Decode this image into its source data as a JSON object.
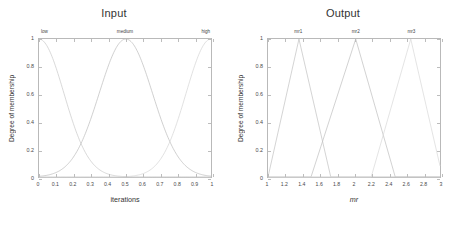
{
  "figure": {
    "background": "#ffffff",
    "axis_color": "#b9b9b9",
    "text_color": "#333333"
  },
  "panels": [
    {
      "id": "input",
      "title": "Input",
      "xlabel": "iterations",
      "ylabel": "Degree of membership",
      "xlabel_italic": false,
      "xticks": [
        "0",
        "0.1",
        "0.2",
        "0.3",
        "0.4",
        "0.5",
        "0.6",
        "0.7",
        "0.8",
        "0.9",
        "1"
      ],
      "xtickvals": [
        0,
        0.1,
        0.2,
        0.3,
        0.4,
        0.5,
        0.6,
        0.7,
        0.8,
        0.9,
        1
      ],
      "yticks": [
        "0",
        "0.2",
        "0.4",
        "0.6",
        "0.8",
        "1"
      ],
      "ytickvals": [
        0,
        0.2,
        0.4,
        0.6,
        0.8,
        1
      ],
      "xlim": [
        0,
        1
      ],
      "ylim": [
        0,
        1
      ],
      "mf_labels": [
        {
          "text": "low",
          "x": 0.02,
          "anchor": "left"
        },
        {
          "text": "medium",
          "x": 0.5,
          "anchor": "center"
        },
        {
          "text": "high",
          "x": 0.985,
          "anchor": "right"
        }
      ]
    },
    {
      "id": "output",
      "title": "Output",
      "xlabel": "mr",
      "ylabel": "Degree of membership",
      "xlabel_italic": true,
      "xticks": [
        "1",
        "1.2",
        "1.4",
        "1.6",
        "1.8",
        "2",
        "2.2",
        "2.4",
        "2.6",
        "2.8",
        "3"
      ],
      "xtickvals": [
        1,
        1.2,
        1.4,
        1.6,
        1.8,
        2,
        2.2,
        2.4,
        2.6,
        2.8,
        3
      ],
      "yticks": [
        "0",
        "0.2",
        "0.4",
        "0.6",
        "0.8",
        "1"
      ],
      "ytickvals": [
        0,
        0.2,
        0.4,
        0.6,
        0.8,
        1
      ],
      "xlim": [
        1,
        3
      ],
      "ylim": [
        0,
        1
      ],
      "mf_labels": [
        {
          "text": "mr1",
          "x": 1.36,
          "anchor": "center"
        },
        {
          "text": "mr2",
          "x": 2.02,
          "anchor": "center"
        },
        {
          "text": "mr3",
          "x": 2.66,
          "anchor": "center"
        }
      ]
    }
  ],
  "chart_data": [
    {
      "type": "line",
      "title": "Input",
      "xlabel": "iterations",
      "ylabel": "Degree of membership",
      "xlim": [
        0,
        1
      ],
      "ylim": [
        0,
        1
      ],
      "grid": false,
      "legend": "inline-labels-above-axes",
      "note": "Fuzzy Gaussian membership functions for the input variable",
      "series": [
        {
          "name": "low",
          "shape": "gaussmf",
          "color": "#c9c9c9",
          "params": {
            "sigma": 0.145,
            "center": 0.0
          },
          "x": [
            0,
            0.05,
            0.1,
            0.15,
            0.2,
            0.25,
            0.3,
            0.35,
            0.4,
            0.5,
            0.6,
            0.7,
            0.8,
            0.9,
            1.0
          ],
          "y": [
            1.0,
            0.942,
            0.787,
            0.583,
            0.384,
            0.225,
            0.117,
            0.054,
            0.022,
            0.002,
            0.0,
            0.0,
            0.0,
            0.0,
            0.0
          ]
        },
        {
          "name": "medium",
          "shape": "gaussmf",
          "color": "#bcbcbc",
          "params": {
            "sigma": 0.155,
            "center": 0.505
          },
          "x": [
            0,
            0.1,
            0.2,
            0.25,
            0.3,
            0.35,
            0.4,
            0.45,
            0.5,
            0.55,
            0.6,
            0.65,
            0.7,
            0.75,
            0.8,
            0.9,
            1.0
          ],
          "y": [
            0.042,
            0.123,
            0.288,
            0.396,
            0.54,
            0.689,
            0.83,
            0.942,
            0.999,
            0.986,
            0.895,
            0.756,
            0.598,
            0.436,
            0.296,
            0.099,
            0.021
          ]
        },
        {
          "name": "high",
          "shape": "gaussmf",
          "color": "#d4d4d4",
          "params": {
            "sigma": 0.145,
            "center": 1.0
          },
          "x": [
            0,
            0.1,
            0.2,
            0.3,
            0.4,
            0.5,
            0.6,
            0.65,
            0.7,
            0.75,
            0.8,
            0.85,
            0.9,
            0.95,
            1.0
          ],
          "y": [
            0.0,
            0.0,
            0.0,
            0.0,
            0.019,
            0.052,
            0.133,
            0.203,
            0.299,
            0.416,
            0.545,
            0.677,
            0.795,
            0.887,
            1.0
          ]
        }
      ]
    },
    {
      "type": "line",
      "title": "Output",
      "xlabel": "mr",
      "ylabel": "Degree of membership",
      "xlim": [
        1,
        3
      ],
      "ylim": [
        0,
        1
      ],
      "grid": false,
      "legend": "inline-labels-above-axes",
      "note": "Fuzzy triangular membership functions for the output variable",
      "series": [
        {
          "name": "mr1",
          "shape": "trimf",
          "color": "#c2c2c2",
          "params": {
            "a": 1.0,
            "b": 1.36,
            "c": 1.73
          },
          "x": [
            1.0,
            1.36,
            1.73,
            3.0
          ],
          "y": [
            0.0,
            1.0,
            0.0,
            0.0
          ]
        },
        {
          "name": "mr2",
          "shape": "trimf",
          "color": "#bfbfbf",
          "params": {
            "a": 1.5,
            "b": 2.02,
            "c": 2.48
          },
          "x": [
            1.0,
            1.5,
            2.02,
            2.48,
            3.0
          ],
          "y": [
            0.0,
            0.0,
            1.0,
            0.0,
            0.0
          ]
        },
        {
          "name": "mr3",
          "shape": "trimf",
          "color": "#d8d8d8",
          "params": {
            "a": 2.2,
            "b": 2.66,
            "c": 3.0
          },
          "x": [
            1.0,
            2.2,
            2.66,
            3.0
          ],
          "y": [
            0.0,
            0.0,
            1.0,
            0.08
          ]
        }
      ]
    }
  ]
}
